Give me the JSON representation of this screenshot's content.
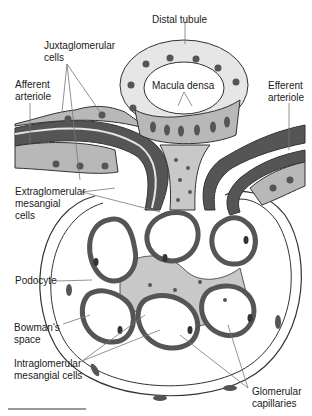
{
  "labels": {
    "distal_tubule": "Distal tubule",
    "juxtaglomerular_cells": "Juxtaglomerular\ncells",
    "afferent_arteriole": "Afferent\narteriole",
    "macula_densa": "Macula densa",
    "efferent_arteriole": "Efferent\narteriole",
    "extraglomerular_mesangial_cells": "Extraglomerular\nmesangial\ncells",
    "podocyte": "Podocyte",
    "bowmans_space": "Bowman's\nspace",
    "intraglomerular_mesangial_cells": "Intraglomerular\nmesangial cells",
    "glomerular_capillaries": "Glomerular\ncapillaries"
  },
  "colors": {
    "vessel_wall": "#555555",
    "cell_fill": "#b8b8b8",
    "light_cell": "#e6e6e6",
    "nucleus": "#555555",
    "mesangium": "#c8c8c8",
    "outline": "#333333",
    "leader_line": "#777777"
  }
}
